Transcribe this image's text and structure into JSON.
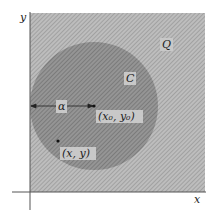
{
  "diagram": {
    "axes": {
      "x_label": "x",
      "y_label": "y"
    },
    "region_label": "Q",
    "circle_label": "C",
    "radius_label": "α",
    "center_label": "(x₀, y₀)",
    "point_label": "(x, y)",
    "colors": {
      "region_fill": "#b4b4b4",
      "circle_fill": "#8e8e8e",
      "axis": "#444444",
      "label_box": "#c8c8c8"
    }
  }
}
